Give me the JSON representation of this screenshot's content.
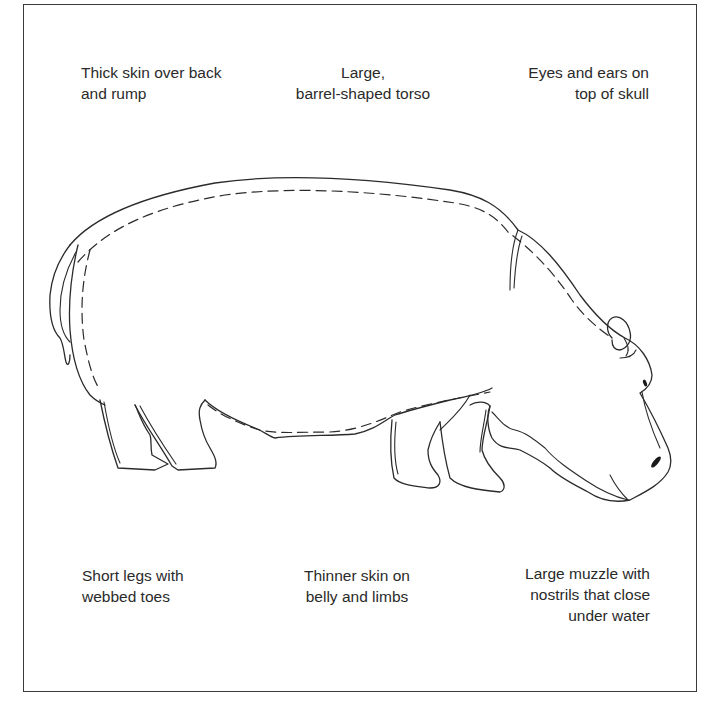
{
  "figure": {
    "colors": {
      "background": "#ffffff",
      "line": "#2b2b2b",
      "frame": "#3a3a3a",
      "text": "#2a2a2a"
    }
  },
  "labels": {
    "thick_skin": {
      "line1": "Thick skin over back",
      "line2": "and rump"
    },
    "torso": {
      "line1": "Large,",
      "line2": "barrel-shaped torso"
    },
    "eyes_ears": {
      "line1": "Eyes and ears on",
      "line2": "top of skull"
    },
    "short_legs": {
      "line1": "Short legs with",
      "line2": "webbed toes"
    },
    "thinner_skin": {
      "line1": "Thinner skin on",
      "line2": "belly and limbs"
    },
    "muzzle": {
      "line1": "Large muzzle with",
      "line2": "nostrils that close",
      "line3": "under water"
    }
  }
}
